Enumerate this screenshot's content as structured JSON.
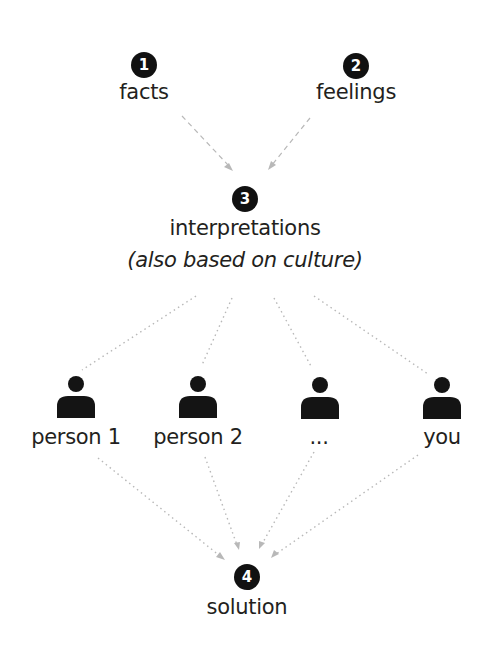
{
  "diagram": {
    "colors": {
      "badge": "#111111",
      "badge_text": "#ffffff",
      "connector": "#b8b8b8",
      "text": "#231f20",
      "person_icon": "#141414"
    },
    "nodes": {
      "facts": {
        "number": "1",
        "label": "facts"
      },
      "feelings": {
        "number": "2",
        "label": "feelings"
      },
      "interpretations": {
        "number": "3",
        "label": "interpretations",
        "sublabel": "(also based on culture)"
      },
      "solution": {
        "number": "4",
        "label": "solution"
      }
    },
    "people": [
      {
        "label": "person 1",
        "icon": "person-icon"
      },
      {
        "label": "person 2",
        "icon": "person-icon"
      },
      {
        "label": "...",
        "icon": "person-icon"
      },
      {
        "label": "you",
        "icon": "person-icon"
      }
    ],
    "edges": [
      {
        "from": "facts",
        "to": "interpretations",
        "style": "dashed"
      },
      {
        "from": "feelings",
        "to": "interpretations",
        "style": "dashed"
      },
      {
        "from": "interpretations",
        "to": "person 1",
        "style": "dotted"
      },
      {
        "from": "interpretations",
        "to": "person 2",
        "style": "dotted"
      },
      {
        "from": "interpretations",
        "to": "...",
        "style": "dotted"
      },
      {
        "from": "interpretations",
        "to": "you",
        "style": "dotted"
      },
      {
        "from": "person 1",
        "to": "solution",
        "style": "dotted"
      },
      {
        "from": "person 2",
        "to": "solution",
        "style": "dotted"
      },
      {
        "from": "...",
        "to": "solution",
        "style": "dotted"
      },
      {
        "from": "you",
        "to": "solution",
        "style": "dotted"
      }
    ]
  }
}
